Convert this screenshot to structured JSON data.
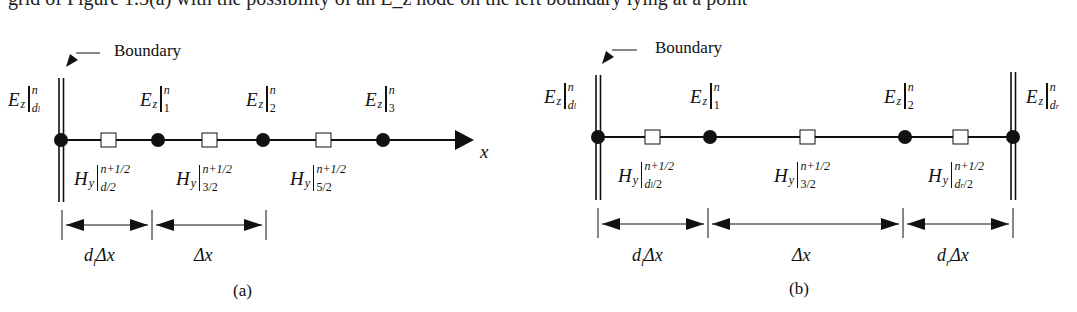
{
  "header": {
    "partial_text": "grid of Figure 1.5(a) with the possibility of an E_z node on the left boundary lying at a point"
  },
  "panel_a": {
    "caption": "(a)",
    "boundary_label": "Boundary",
    "axis_label": "x",
    "e_nodes": [
      {
        "base": "E",
        "comp": "z",
        "sup": "n",
        "sub": "d",
        "sub2": "l"
      },
      {
        "base": "E",
        "comp": "z",
        "sup": "n",
        "sub": "1"
      },
      {
        "base": "E",
        "comp": "z",
        "sup": "n",
        "sub": "2"
      },
      {
        "base": "E",
        "comp": "z",
        "sup": "n",
        "sub": "3"
      }
    ],
    "h_nodes": [
      {
        "base": "H",
        "comp": "y",
        "sup": "n+1/2",
        "sub": "d/2"
      },
      {
        "base": "H",
        "comp": "y",
        "sup": "n+1/2",
        "sub": "3/2"
      },
      {
        "base": "H",
        "comp": "y",
        "sup": "n+1/2",
        "sub": "5/2"
      }
    ],
    "dimensions": [
      {
        "label": "d",
        "label_sub": "l",
        "label_rest": "Δx"
      },
      {
        "label": "",
        "label_sub": "",
        "label_rest": "Δx"
      }
    ]
  },
  "panel_b": {
    "caption": "(b)",
    "boundary_label": "Boundary",
    "e_nodes": [
      {
        "base": "E",
        "comp": "z",
        "sup": "n",
        "sub": "d",
        "sub2": "l"
      },
      {
        "base": "E",
        "comp": "z",
        "sup": "n",
        "sub": "1"
      },
      {
        "base": "E",
        "comp": "z",
        "sup": "n",
        "sub": "2"
      },
      {
        "base": "E",
        "comp": "z",
        "sup": "n",
        "sub": "d",
        "sub2": "r"
      }
    ],
    "h_nodes": [
      {
        "base": "H",
        "comp": "y",
        "sup": "n+1/2",
        "sub": "d",
        "sub2": "l",
        "sub_rest": "/2"
      },
      {
        "base": "H",
        "comp": "y",
        "sup": "n+1/2",
        "sub": "3/2"
      },
      {
        "base": "H",
        "comp": "y",
        "sup": "n+1/2",
        "sub": "d",
        "sub2": "r",
        "sub_rest": "/2"
      }
    ],
    "dimensions": [
      {
        "label": "d",
        "label_sub": "l",
        "label_rest": "Δx"
      },
      {
        "label": "",
        "label_sub": "",
        "label_rest": "Δx"
      },
      {
        "label": "d",
        "label_sub": "r",
        "label_rest": "Δx"
      }
    ]
  },
  "colors": {
    "ink": "#111111",
    "background": "#ffffff"
  }
}
